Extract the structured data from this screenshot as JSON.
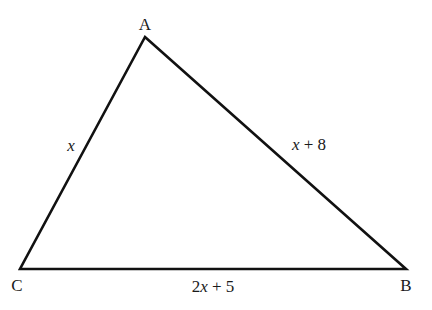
{
  "diagram": {
    "type": "triangle",
    "vertices": {
      "A": {
        "label": "A",
        "x": 145,
        "y": 37
      },
      "B": {
        "label": "B",
        "x": 406,
        "y": 269
      },
      "C": {
        "label": "C",
        "x": 20,
        "y": 269
      }
    },
    "sides": {
      "AC": {
        "var": "x",
        "rest": ""
      },
      "AB": {
        "var": "x",
        "rest": " + 8"
      },
      "CB": {
        "pre": "2",
        "var": "x",
        "rest": " + 5"
      }
    },
    "colors": {
      "line": "#111111",
      "text": "#1a1a1a",
      "background": "#ffffff"
    }
  }
}
